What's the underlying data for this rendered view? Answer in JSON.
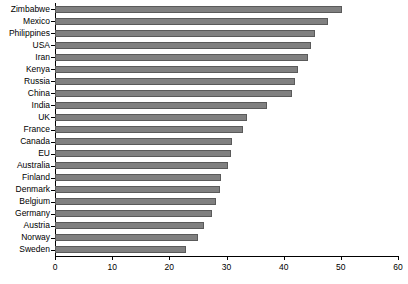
{
  "chart_data": {
    "type": "bar",
    "orientation": "horizontal",
    "title": "",
    "subtitle": "",
    "xlabel": "",
    "ylabel": "",
    "xlim": [
      0,
      60
    ],
    "xticks": [
      0,
      10,
      20,
      30,
      40,
      50,
      60
    ],
    "grid": false,
    "legend": false,
    "bar_color": "#808080",
    "bar_edge_color": "#5a5a5a",
    "background_color": "#ffffff",
    "axis_color": "#000000",
    "categories": [
      "Zimbabwe",
      "Mexico",
      "Philippines",
      "USA",
      "Iran",
      "Kenya",
      "Russia",
      "China",
      "India",
      "UK",
      "France",
      "Canada",
      "EU",
      "Australia",
      "Finland",
      "Denmark",
      "Belgium",
      "Germany",
      "Austria",
      "Norway",
      "Sweden"
    ],
    "values": [
      50.2,
      47.8,
      45.5,
      44.8,
      44.2,
      42.5,
      42.0,
      41.5,
      37.0,
      33.5,
      32.8,
      31.0,
      30.8,
      30.2,
      29.0,
      28.8,
      28.2,
      27.5,
      26.0,
      25.0,
      23.0
    ]
  }
}
